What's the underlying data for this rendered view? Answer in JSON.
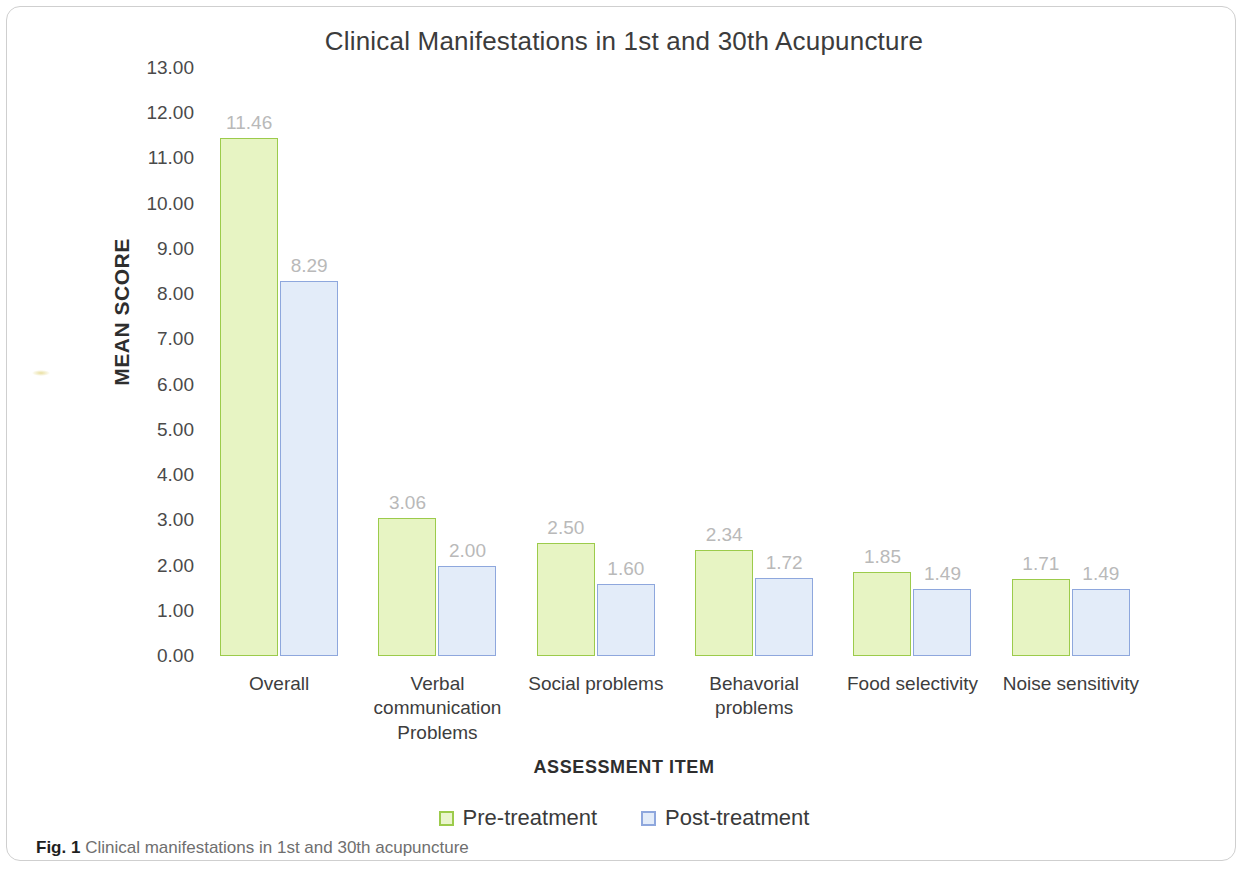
{
  "figure": {
    "caption_label": "Fig. 1",
    "caption_text": "Clinical manifestations in 1st and 30th acupuncture"
  },
  "chart_data": {
    "type": "bar",
    "title": "Clinical Manifestations in 1st and 30th Acupuncture",
    "xlabel": "ASSESSMENT ITEM",
    "ylabel": "MEAN SCORE",
    "ylim": [
      0,
      13
    ],
    "ytick_step": 1,
    "yticks": [
      "13.00",
      "12.00",
      "11.00",
      "10.00",
      "9.00",
      "8.00",
      "7.00",
      "6.00",
      "5.00",
      "4.00",
      "3.00",
      "2.00",
      "1.00",
      "0.00"
    ],
    "grid": false,
    "legend_position": "bottom",
    "categories": [
      "Overall",
      "Verbal communication Problems",
      "Social problems",
      "Behavorial problems",
      "Food selectivity",
      "Noise sensitivity"
    ],
    "series": [
      {
        "name": "Pre-treatment",
        "color": "#9ccb4b",
        "fill": "#e7f4c3",
        "values": [
          11.46,
          3.06,
          2.5,
          2.34,
          1.85,
          1.71
        ],
        "labels": [
          "11.46",
          "3.06",
          "2.50",
          "2.34",
          "1.85",
          "1.71"
        ]
      },
      {
        "name": "Post-treatment",
        "color": "#8ea7dd",
        "fill": "#e3ecf9",
        "values": [
          8.29,
          2.0,
          1.6,
          1.72,
          1.49,
          1.49
        ],
        "labels": [
          "8.29",
          "2.00",
          "1.60",
          "1.72",
          "1.49",
          "1.49"
        ]
      }
    ]
  }
}
